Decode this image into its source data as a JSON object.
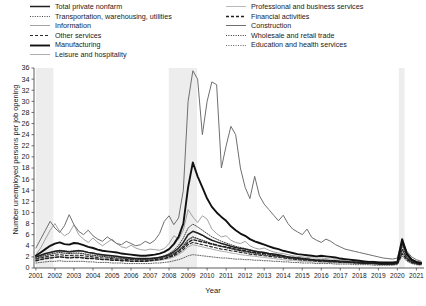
{
  "chart_data": {
    "type": "line",
    "title": "",
    "xlabel": "Year",
    "ylabel": "Number unemployed persons per job opening",
    "xlim": [
      2000.9,
      2021.4
    ],
    "ylim": [
      0,
      36
    ],
    "ytick_step": 2,
    "yticks": [
      0,
      2,
      4,
      6,
      8,
      10,
      12,
      14,
      16,
      18,
      20,
      22,
      24,
      26,
      28,
      30,
      32,
      34,
      36
    ],
    "xticks": [
      2001,
      2002,
      2003,
      2004,
      2005,
      2006,
      2007,
      2008,
      2009,
      2010,
      2011,
      2012,
      2013,
      2014,
      2015,
      2016,
      2017,
      2018,
      2019,
      2020,
      2021
    ],
    "grid": false,
    "legend_position": "above-plot-two-columns",
    "shaded_regions": [
      {
        "name": "recession-2001",
        "x0": 2001.0,
        "x1": 2001.92,
        "color": "#ededed"
      },
      {
        "name": "recession-2008",
        "x0": 2007.98,
        "x1": 2009.47,
        "color": "#ededed"
      },
      {
        "name": "recession-2020",
        "x0": 2020.08,
        "x1": 2020.38,
        "color": "#ededed"
      }
    ],
    "x": [
      2001.0,
      2001.25,
      2001.5,
      2001.75,
      2002.0,
      2002.25,
      2002.5,
      2002.75,
      2003.0,
      2003.25,
      2003.5,
      2003.75,
      2004.0,
      2004.25,
      2004.5,
      2004.75,
      2005.0,
      2005.25,
      2005.5,
      2005.75,
      2006.0,
      2006.25,
      2006.5,
      2006.75,
      2007.0,
      2007.25,
      2007.5,
      2007.75,
      2008.0,
      2008.25,
      2008.5,
      2008.75,
      2009.0,
      2009.25,
      2009.5,
      2009.75,
      2010.0,
      2010.25,
      2010.5,
      2010.75,
      2011.0,
      2011.25,
      2011.5,
      2011.75,
      2012.0,
      2012.25,
      2012.5,
      2012.75,
      2013.0,
      2013.25,
      2013.5,
      2013.75,
      2014.0,
      2014.25,
      2014.5,
      2014.75,
      2015.0,
      2015.25,
      2015.5,
      2015.75,
      2016.0,
      2016.25,
      2016.5,
      2016.75,
      2017.0,
      2017.25,
      2017.5,
      2017.75,
      2018.0,
      2018.25,
      2018.5,
      2018.75,
      2019.0,
      2019.25,
      2019.5,
      2019.75,
      2020.0,
      2020.25,
      2020.5,
      2020.75,
      2021.0,
      2021.25
    ],
    "series": [
      {
        "name": "Total private nonfarm",
        "style": "solid",
        "width": 1.5,
        "color": "#1f1f1f",
        "values": [
          2.0,
          2.3,
          2.6,
          2.8,
          3.0,
          3.1,
          3.0,
          2.9,
          3.0,
          3.1,
          3.0,
          2.8,
          2.7,
          2.5,
          2.4,
          2.3,
          2.2,
          2.1,
          2.0,
          1.9,
          1.8,
          1.7,
          1.7,
          1.7,
          1.7,
          1.8,
          1.9,
          2.1,
          2.4,
          2.9,
          3.6,
          4.6,
          6.0,
          6.6,
          6.3,
          5.9,
          5.4,
          5.0,
          4.7,
          4.4,
          4.2,
          3.9,
          3.7,
          3.5,
          3.4,
          3.2,
          3.0,
          2.9,
          2.8,
          2.6,
          2.5,
          2.4,
          2.2,
          2.0,
          1.9,
          1.8,
          1.7,
          1.6,
          1.5,
          1.4,
          1.4,
          1.4,
          1.3,
          1.3,
          1.2,
          1.2,
          1.1,
          1.1,
          1.0,
          0.9,
          0.9,
          0.9,
          0.8,
          0.8,
          0.8,
          0.8,
          0.9,
          4.6,
          2.4,
          1.4,
          1.0,
          0.8
        ]
      },
      {
        "name": "Transportation, warehousing, utilities",
        "style": "dotted",
        "width": 0.9,
        "color": "#2b2b2b",
        "values": [
          1.9,
          2.2,
          2.5,
          2.8,
          3.0,
          3.2,
          3.1,
          3.0,
          3.1,
          3.2,
          3.0,
          2.8,
          2.6,
          2.4,
          2.3,
          2.2,
          2.1,
          2.0,
          1.9,
          1.8,
          1.7,
          1.7,
          1.6,
          1.6,
          1.7,
          1.8,
          2.0,
          2.2,
          2.6,
          3.2,
          4.1,
          5.4,
          7.2,
          7.9,
          7.4,
          6.8,
          6.2,
          5.6,
          5.2,
          4.8,
          4.5,
          4.2,
          3.9,
          3.7,
          3.5,
          3.3,
          3.1,
          2.9,
          2.8,
          2.6,
          2.4,
          2.3,
          2.1,
          1.9,
          1.8,
          1.7,
          1.6,
          1.5,
          1.4,
          1.4,
          1.3,
          1.3,
          1.2,
          1.2,
          1.1,
          1.1,
          1.0,
          1.0,
          0.9,
          0.9,
          0.8,
          0.8,
          0.8,
          0.7,
          0.7,
          0.8,
          0.9,
          4.0,
          2.0,
          1.2,
          0.9,
          0.7
        ]
      },
      {
        "name": "Information",
        "style": "solid",
        "width": 0.8,
        "color": "#8a8a8a",
        "values": [
          2.4,
          3.6,
          5.2,
          6.8,
          8.0,
          6.6,
          5.8,
          6.3,
          7.8,
          6.0,
          5.2,
          4.6,
          5.4,
          4.6,
          4.0,
          4.6,
          5.2,
          4.4,
          3.8,
          3.6,
          4.1,
          3.6,
          3.3,
          3.2,
          3.4,
          3.3,
          3.2,
          3.5,
          4.4,
          5.8,
          5.2,
          6.8,
          10.5,
          9.2,
          8.2,
          9.4,
          8.8,
          7.0,
          6.2,
          5.6,
          5.8,
          5.0,
          4.6,
          4.4,
          4.8,
          4.0,
          3.6,
          3.4,
          3.6,
          3.2,
          2.9,
          2.7,
          2.6,
          2.4,
          2.2,
          2.1,
          2.0,
          1.9,
          1.8,
          1.8,
          1.8,
          1.7,
          1.6,
          1.6,
          1.6,
          1.5,
          1.4,
          1.4,
          1.3,
          1.2,
          1.2,
          1.2,
          1.1,
          1.0,
          1.0,
          1.0,
          1.1,
          4.4,
          2.6,
          1.6,
          1.2,
          1.0
        ]
      },
      {
        "name": "Other services",
        "style": "dashed",
        "width": 1.1,
        "color": "#2b2b2b",
        "values": [
          1.6,
          1.8,
          2.0,
          2.2,
          2.3,
          2.4,
          2.3,
          2.2,
          2.3,
          2.3,
          2.2,
          2.1,
          2.0,
          1.9,
          1.8,
          1.8,
          1.7,
          1.6,
          1.6,
          1.5,
          1.5,
          1.4,
          1.4,
          1.4,
          1.4,
          1.5,
          1.6,
          1.7,
          1.9,
          2.2,
          2.7,
          3.3,
          4.2,
          4.6,
          4.4,
          4.2,
          4.0,
          3.8,
          3.6,
          3.4,
          3.3,
          3.1,
          3.0,
          2.8,
          2.7,
          2.5,
          2.4,
          2.3,
          2.2,
          2.1,
          2.0,
          1.9,
          1.8,
          1.7,
          1.6,
          1.5,
          1.4,
          1.4,
          1.3,
          1.2,
          1.2,
          1.2,
          1.1,
          1.1,
          1.0,
          1.0,
          1.0,
          0.9,
          0.9,
          0.8,
          0.8,
          0.8,
          0.7,
          0.7,
          0.7,
          0.7,
          0.8,
          3.4,
          1.8,
          1.1,
          0.9,
          0.7
        ]
      },
      {
        "name": "Manufacturing",
        "style": "solid",
        "width": 1.9,
        "color": "#111111",
        "values": [
          2.2,
          2.8,
          3.4,
          4.0,
          4.4,
          4.6,
          4.3,
          4.2,
          4.5,
          4.4,
          4.1,
          3.8,
          3.6,
          3.3,
          3.1,
          3.0,
          2.9,
          2.8,
          2.6,
          2.5,
          2.4,
          2.3,
          2.2,
          2.2,
          2.3,
          2.4,
          2.6,
          2.9,
          3.4,
          4.3,
          5.6,
          8.0,
          14.5,
          19.0,
          16.5,
          14.5,
          12.5,
          11.0,
          10.0,
          9.2,
          8.5,
          7.5,
          6.8,
          6.2,
          5.8,
          5.2,
          4.8,
          4.5,
          4.2,
          3.9,
          3.6,
          3.4,
          3.1,
          2.9,
          2.7,
          2.5,
          2.4,
          2.3,
          2.2,
          2.1,
          2.2,
          2.1,
          2.0,
          1.9,
          1.7,
          1.6,
          1.5,
          1.4,
          1.3,
          1.2,
          1.1,
          1.1,
          1.0,
          1.0,
          1.0,
          1.0,
          1.1,
          5.2,
          2.6,
          1.5,
          1.1,
          0.9
        ]
      },
      {
        "name": "Leisure and hospitality",
        "style": "solid",
        "width": 0.8,
        "color": "#9a9a9a",
        "values": [
          1.4,
          1.6,
          1.8,
          1.9,
          2.0,
          2.1,
          2.0,
          1.9,
          2.0,
          2.0,
          1.9,
          1.8,
          1.8,
          1.7,
          1.6,
          1.6,
          1.5,
          1.5,
          1.4,
          1.4,
          1.3,
          1.3,
          1.2,
          1.2,
          1.3,
          1.3,
          1.4,
          1.5,
          1.7,
          2.0,
          2.4,
          3.0,
          3.8,
          4.2,
          4.0,
          3.8,
          3.6,
          3.4,
          3.2,
          3.0,
          2.9,
          2.7,
          2.6,
          2.4,
          2.3,
          2.2,
          2.1,
          2.0,
          1.9,
          1.8,
          1.7,
          1.6,
          1.5,
          1.4,
          1.4,
          1.3,
          1.2,
          1.2,
          1.1,
          1.1,
          1.0,
          1.0,
          1.0,
          0.9,
          0.9,
          0.9,
          0.8,
          0.8,
          0.8,
          0.7,
          0.7,
          0.7,
          0.6,
          0.6,
          0.6,
          0.6,
          0.7,
          3.0,
          1.5,
          0.9,
          0.7,
          0.5
        ]
      },
      {
        "name": "Professional and business services",
        "style": "solid",
        "width": 0.8,
        "color": "#a8a8a8",
        "values": [
          1.6,
          1.9,
          2.2,
          2.4,
          2.6,
          2.7,
          2.6,
          2.5,
          2.6,
          2.6,
          2.5,
          2.3,
          2.2,
          2.1,
          2.0,
          1.9,
          1.8,
          1.8,
          1.7,
          1.6,
          1.6,
          1.5,
          1.5,
          1.5,
          1.5,
          1.6,
          1.7,
          1.9,
          2.1,
          2.5,
          3.1,
          3.9,
          5.0,
          5.5,
          5.2,
          4.9,
          4.6,
          4.3,
          4.0,
          3.8,
          3.6,
          3.4,
          3.2,
          3.0,
          2.9,
          2.7,
          2.6,
          2.4,
          2.3,
          2.2,
          2.1,
          2.0,
          1.9,
          1.7,
          1.6,
          1.5,
          1.5,
          1.4,
          1.3,
          1.3,
          1.2,
          1.2,
          1.1,
          1.1,
          1.1,
          1.0,
          1.0,
          0.9,
          0.9,
          0.8,
          0.8,
          0.8,
          0.7,
          0.7,
          0.7,
          0.7,
          0.8,
          3.2,
          1.7,
          1.0,
          0.8,
          0.6
        ]
      },
      {
        "name": "Financial activities",
        "style": "dashed",
        "width": 1.4,
        "color": "#1f1f1f",
        "values": [
          1.3,
          1.5,
          1.7,
          1.8,
          1.9,
          2.0,
          1.9,
          1.8,
          1.9,
          1.9,
          1.8,
          1.7,
          1.7,
          1.6,
          1.5,
          1.5,
          1.4,
          1.4,
          1.3,
          1.3,
          1.2,
          1.2,
          1.2,
          1.2,
          1.3,
          1.4,
          1.5,
          1.7,
          2.0,
          2.4,
          3.0,
          3.7,
          4.6,
          5.1,
          4.9,
          4.7,
          4.5,
          4.3,
          4.1,
          3.9,
          3.8,
          3.6,
          3.4,
          3.2,
          3.1,
          2.9,
          2.8,
          2.7,
          2.6,
          2.5,
          2.3,
          2.2,
          2.1,
          2.0,
          1.9,
          1.8,
          1.7,
          1.6,
          1.5,
          1.4,
          1.4,
          1.3,
          1.3,
          1.2,
          1.2,
          1.1,
          1.1,
          1.0,
          1.0,
          0.9,
          0.9,
          0.8,
          0.8,
          0.7,
          0.7,
          0.7,
          0.8,
          2.6,
          1.5,
          1.0,
          0.8,
          0.6
        ]
      },
      {
        "name": "Construction",
        "style": "solid",
        "width": 1.0,
        "color": "#6f6f6f",
        "values": [
          3.6,
          5.2,
          6.8,
          8.4,
          7.2,
          6.4,
          7.6,
          9.6,
          7.8,
          6.6,
          6.0,
          6.8,
          5.8,
          5.2,
          4.8,
          5.6,
          5.0,
          4.4,
          4.2,
          4.8,
          4.4,
          4.0,
          4.2,
          4.8,
          4.4,
          5.0,
          6.2,
          8.4,
          9.4,
          7.8,
          9.0,
          14.0,
          30.0,
          35.5,
          34.0,
          24.0,
          30.0,
          33.5,
          33.0,
          18.0,
          22.0,
          25.5,
          24.0,
          18.0,
          14.5,
          12.5,
          16.5,
          13.0,
          11.5,
          10.5,
          9.5,
          8.5,
          9.5,
          8.0,
          7.0,
          6.5,
          6.0,
          7.0,
          5.5,
          5.0,
          4.6,
          5.2,
          4.8,
          4.2,
          3.8,
          3.4,
          3.2,
          3.0,
          2.8,
          2.6,
          2.4,
          2.2,
          2.0,
          1.8,
          1.7,
          1.6,
          1.8,
          5.0,
          3.0,
          2.0,
          1.5,
          1.2
        ]
      },
      {
        "name": "Wholesale and retail trade",
        "style": "dotted",
        "width": 1.1,
        "color": "#333333",
        "values": [
          1.7,
          2.0,
          2.3,
          2.5,
          2.7,
          2.8,
          2.7,
          2.6,
          2.7,
          2.7,
          2.6,
          2.4,
          2.3,
          2.2,
          2.1,
          2.0,
          1.9,
          1.8,
          1.8,
          1.7,
          1.6,
          1.6,
          1.5,
          1.5,
          1.6,
          1.7,
          1.8,
          2.0,
          2.2,
          2.6,
          3.2,
          4.0,
          5.1,
          5.6,
          5.3,
          5.0,
          4.7,
          4.4,
          4.2,
          3.9,
          3.7,
          3.5,
          3.3,
          3.1,
          3.0,
          2.8,
          2.7,
          2.5,
          2.4,
          2.3,
          2.2,
          2.1,
          1.9,
          1.8,
          1.7,
          1.6,
          1.5,
          1.5,
          1.4,
          1.3,
          1.3,
          1.2,
          1.2,
          1.1,
          1.1,
          1.1,
          1.0,
          1.0,
          0.9,
          0.9,
          0.8,
          0.8,
          0.8,
          0.7,
          0.7,
          0.7,
          0.8,
          3.4,
          1.8,
          1.1,
          0.8,
          0.7
        ]
      },
      {
        "name": "Education and health services",
        "style": "dotted",
        "width": 0.9,
        "color": "#555555",
        "values": [
          0.9,
          1.0,
          1.1,
          1.2,
          1.2,
          1.3,
          1.2,
          1.2,
          1.2,
          1.2,
          1.2,
          1.1,
          1.1,
          1.0,
          1.0,
          1.0,
          0.9,
          0.9,
          0.9,
          0.8,
          0.8,
          0.8,
          0.8,
          0.8,
          0.8,
          0.9,
          0.9,
          1.0,
          1.1,
          1.3,
          1.5,
          1.8,
          2.2,
          2.4,
          2.3,
          2.2,
          2.1,
          2.0,
          1.9,
          1.8,
          1.8,
          1.7,
          1.6,
          1.6,
          1.5,
          1.5,
          1.4,
          1.4,
          1.3,
          1.3,
          1.2,
          1.2,
          1.1,
          1.1,
          1.0,
          1.0,
          0.9,
          0.9,
          0.9,
          0.8,
          0.8,
          0.8,
          0.8,
          0.7,
          0.7,
          0.7,
          0.7,
          0.6,
          0.6,
          0.6,
          0.6,
          0.5,
          0.5,
          0.5,
          0.5,
          0.5,
          0.6,
          2.2,
          1.2,
          0.8,
          0.6,
          0.5
        ]
      }
    ]
  },
  "legend": {
    "left_column": [
      {
        "label": "Total private nonfarm",
        "series": 0
      },
      {
        "label": "Transportation, warehousing, utilities",
        "series": 1
      },
      {
        "label": "Information",
        "series": 2
      },
      {
        "label": "Other services",
        "series": 3
      },
      {
        "label": "Manufacturing",
        "series": 4
      },
      {
        "label": "Leisure and hospitality",
        "series": 5
      }
    ],
    "right_column": [
      {
        "label": "Professional and business services",
        "series": 6
      },
      {
        "label": "Financial activities",
        "series": 7
      },
      {
        "label": "Construction",
        "series": 8
      },
      {
        "label": "Wholesale and retail trade",
        "series": 9
      },
      {
        "label": "Education and health services",
        "series": 10
      }
    ]
  }
}
